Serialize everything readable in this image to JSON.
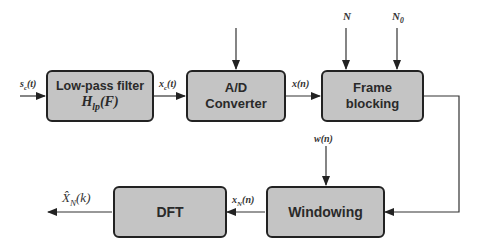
{
  "blocks": {
    "lowpass": {
      "title": "Low-pass filter",
      "math": "H",
      "math_sub": "lp",
      "math_tail": "(F)"
    },
    "adc": {
      "line1": "A/D",
      "line2": "Converter"
    },
    "frame": {
      "line1": "Frame",
      "line2": "blocking"
    },
    "windowing": {
      "label": "Windowing"
    },
    "dft": {
      "label": "DFT"
    }
  },
  "signals": {
    "input": {
      "base": "s",
      "sub": "c",
      "tail": "(t)"
    },
    "filtered": {
      "base": "x",
      "sub": "c",
      "tail": "(t)"
    },
    "sampled": "x(n)",
    "frame_len": "N",
    "frame_shift": {
      "base": "N",
      "sub": "0"
    },
    "window": "w(n)",
    "windowed": {
      "base": "x",
      "sub": "N",
      "tail": "(n)"
    },
    "output": {
      "base": "X̂",
      "sub": "N",
      "tail": "(k)"
    }
  }
}
